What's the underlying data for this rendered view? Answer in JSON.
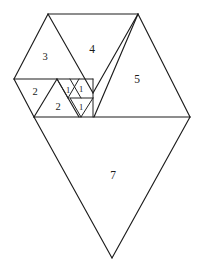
{
  "figure": {
    "background_color": "#ffffff",
    "line_color": "#1c1c1c",
    "label_color": "#1a1a1a",
    "unit_px": 11.2,
    "baseline_y": 117,
    "pieces": [
      {
        "id": "piece-7",
        "label": "7",
        "size": 7,
        "orientation": "down",
        "label_x": 113,
        "label_y": 176,
        "points": "34,117 190,117 112,258"
      },
      {
        "id": "piece-5",
        "label": "5",
        "size": 5,
        "orientation": "up",
        "label_x": 137,
        "label_y": 80,
        "points": "94,117 190,117 138,14"
      },
      {
        "id": "piece-4",
        "label": "4",
        "size": 4,
        "orientation": "down",
        "label_x": 92,
        "label_y": 50,
        "points": "48,14 138,14 93,93"
      },
      {
        "id": "piece-3",
        "label": "3",
        "size": 3,
        "orientation": "up",
        "label_x": 45,
        "label_y": 58,
        "points": "14,79 82,79 48,14"
      },
      {
        "id": "piece-2a",
        "label": "2",
        "size": 2,
        "orientation": "down",
        "label_x": 35,
        "label_y": 93,
        "points": "14,79 57,79 34,117"
      },
      {
        "id": "piece-2b",
        "label": "2",
        "size": 2,
        "orientation": "up",
        "label_x": 58,
        "label_y": 108,
        "points": "34,117 79,117 57,79"
      },
      {
        "id": "piece-1a",
        "label": "1",
        "size": 1,
        "orientation": "up",
        "label_x": 68,
        "label_y": 91,
        "points": "57,79 79,79 68,98"
      },
      {
        "id": "piece-1b",
        "label": "1",
        "size": 1,
        "orientation": "down",
        "label_x": 81,
        "label_y": 90,
        "points": "70,79 93,79 81,98"
      },
      {
        "id": "piece-1c",
        "label": "1",
        "size": 1,
        "orientation": "down",
        "label_x": 81,
        "label_y": 108,
        "points": "70,98 93,98 81,117"
      }
    ],
    "edges": [
      {
        "id": "edge-top",
        "d": "M 48,14 L 138,14"
      },
      {
        "id": "edge-upper-left",
        "d": "M 48,14 L 14,79"
      },
      {
        "id": "edge-three-right",
        "d": "M 48,14 L 93,93"
      },
      {
        "id": "edge-four-right",
        "d": "M 138,14 L 93,93"
      },
      {
        "id": "edge-five-left",
        "d": "M 138,14 L 94,117"
      },
      {
        "id": "edge-five-right",
        "d": "M 138,14 L 190,117"
      },
      {
        "id": "edge-mid-horizontal",
        "d": "M 14,79 L 93,79"
      },
      {
        "id": "edge-baseline",
        "d": "M 34,117 L 190,117"
      },
      {
        "id": "edge-two-a-left",
        "d": "M 14,79 L 34,117"
      },
      {
        "id": "edge-two-a-right",
        "d": "M 57,79 L 34,117"
      },
      {
        "id": "edge-two-b-right",
        "d": "M 57,79 L 79,117"
      },
      {
        "id": "edge-one-a-right",
        "d": "M 79,79 L 68,98"
      },
      {
        "id": "edge-one-a-left",
        "d": "M 57,79 L 68,98"
      },
      {
        "id": "edge-small-horizontal",
        "d": "M 70,98 L 93,98"
      },
      {
        "id": "edge-one-b-left",
        "d": "M 70,79 L 81,98"
      },
      {
        "id": "edge-one-c-left",
        "d": "M 70,98 L 81,117"
      },
      {
        "id": "edge-one-c-right",
        "d": "M 93,98 L 81,117"
      },
      {
        "id": "edge-small-right-column",
        "d": "M 93,79 L 93,117"
      },
      {
        "id": "edge-seven-left",
        "d": "M 34,117 L 112,258"
      },
      {
        "id": "edge-seven-right",
        "d": "M 190,117 L 112,258"
      }
    ]
  }
}
